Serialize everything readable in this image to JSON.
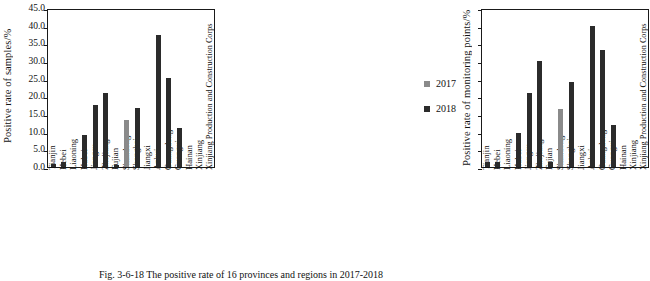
{
  "figure": {
    "caption": "Fig. 3-6-18   The positive rate of 16 provinces and regions in 2017-2018"
  },
  "legend": {
    "position": "right",
    "entries": [
      {
        "label": "2017",
        "color": "#8a8a8a"
      },
      {
        "label": "2018",
        "color": "#2b2b2b"
      }
    ]
  },
  "chart_data": [
    {
      "type": "bar",
      "panel": "left",
      "title": "",
      "ylabel": "Positive rate of samples/%",
      "xlabel": "",
      "ylim": [
        0.0,
        45.0
      ],
      "ytick_step": 5.0,
      "yticks": [
        "0.0",
        "5.0",
        "10.0",
        "15.0",
        "20.0",
        "25.0",
        "30.0",
        "35.0",
        "40.0",
        "45.0"
      ],
      "grid": false,
      "overlap_style": "overlapping",
      "categories": [
        "Tianjin",
        "Hebei",
        "Liaoning",
        "Hubei",
        "Jiangsu",
        "Zhejiang",
        "Fujian",
        "Shandong",
        "Shanghai",
        "Jiangxi",
        "Anhui",
        "Guangdong",
        "Guangxi",
        "Hainan",
        "Xinjiang",
        "Xinjiang Production and Construction Corps"
      ],
      "series": [
        {
          "name": "2017",
          "color": "#8a8a8a",
          "values": [
            0.0,
            0.0,
            0.0,
            5.6,
            11.3,
            6.6,
            0.0,
            13.4,
            5.2,
            0.0,
            0.0,
            0.0,
            0.0,
            0.0,
            0.0,
            0.0
          ]
        },
        {
          "name": "2018",
          "color": "#2b2b2b",
          "values": [
            0.9,
            1.3,
            0.0,
            9.0,
            17.6,
            20.9,
            0.5,
            0.0,
            16.7,
            0.0,
            37.5,
            25.2,
            11.0,
            0.0,
            0.0,
            0.0
          ]
        }
      ]
    },
    {
      "type": "bar",
      "panel": "right",
      "title": "",
      "ylabel": "Positive rate of monitoring points/%",
      "xlabel": "",
      "ylim": [
        0.0,
        45.0
      ],
      "ytick_step": 5.0,
      "yticks": [],
      "grid": false,
      "overlap_style": "overlapping",
      "categories": [
        "Tianjin",
        "Hebei",
        "Liaoning",
        "Hubei",
        "Jiangsu",
        "Zhejiang",
        "Fujian",
        "Shandong",
        "Shanghai",
        "Jiangxi",
        "Anhui",
        "Guangdong",
        "Guangxi",
        "Hainan",
        "Xinjiang",
        "Xinjiang Production and Construction Corps"
      ],
      "series": [
        {
          "name": "2017",
          "color": "#8a8a8a",
          "values": [
            0.0,
            0.0,
            0.0,
            6.0,
            13.0,
            7.0,
            0.0,
            16.5,
            6.5,
            0.0,
            0.0,
            0.0,
            0.0,
            0.0,
            0.0,
            0.0
          ]
        },
        {
          "name": "2018",
          "color": "#2b2b2b",
          "values": [
            1.5,
            1.5,
            0.0,
            9.5,
            21.0,
            30.0,
            1.5,
            0.0,
            24.0,
            0.0,
            40.0,
            33.0,
            12.0,
            0.0,
            0.0,
            0.0
          ]
        }
      ]
    }
  ]
}
